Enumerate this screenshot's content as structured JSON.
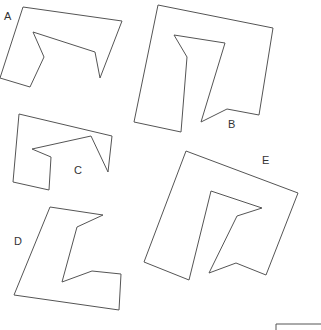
{
  "diagram": {
    "type": "shape-comparison",
    "stroke_color": "#555555",
    "shapes": [
      {
        "id": "A",
        "label": "A",
        "label_pos": [
          4,
          20
        ],
        "points": [
          [
            23,
            7
          ],
          [
            122,
            21
          ],
          [
            100,
            78
          ],
          [
            95,
            52
          ],
          [
            33,
            32
          ],
          [
            44,
            57
          ],
          [
            30,
            87
          ],
          [
            0,
            78
          ]
        ]
      },
      {
        "id": "B",
        "label": "B",
        "label_pos": [
          228,
          128
        ],
        "points": [
          [
            158,
            5
          ],
          [
            273,
            28
          ],
          [
            259,
            115
          ],
          [
            227,
            109
          ],
          [
            201,
            122
          ],
          [
            225,
            43
          ],
          [
            174,
            35
          ],
          [
            187,
            57
          ],
          [
            181,
            132
          ],
          [
            134,
            122
          ]
        ]
      },
      {
        "id": "C",
        "label": "C",
        "label_pos": [
          74,
          174
        ],
        "points": [
          [
            19,
            114
          ],
          [
            112,
            136
          ],
          [
            108,
            172
          ],
          [
            91,
            136
          ],
          [
            32,
            149
          ],
          [
            51,
            157
          ],
          [
            49,
            190
          ],
          [
            13,
            182
          ]
        ]
      },
      {
        "id": "D",
        "label": "D",
        "label_pos": [
          14,
          245
        ],
        "points": [
          [
            50,
            207
          ],
          [
            103,
            215
          ],
          [
            77,
            227
          ],
          [
            62,
            282
          ],
          [
            92,
            271
          ],
          [
            121,
            274
          ],
          [
            119,
            310
          ],
          [
            14,
            295
          ]
        ]
      },
      {
        "id": "E",
        "label": "E",
        "label_pos": [
          262,
          164
        ],
        "points": [
          [
            186,
            151
          ],
          [
            298,
            193
          ],
          [
            266,
            275
          ],
          [
            236,
            263
          ],
          [
            209,
            273
          ],
          [
            237,
            216
          ],
          [
            262,
            208
          ],
          [
            211,
            191
          ],
          [
            189,
            280
          ],
          [
            144,
            262
          ]
        ]
      }
    ],
    "corner_mark": {
      "points": [
        [
          276,
          330
        ],
        [
          276,
          324
        ],
        [
          321,
          324
        ]
      ]
    }
  }
}
